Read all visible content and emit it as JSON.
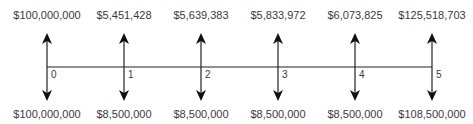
{
  "diagram": {
    "type": "cash-flow-timeline",
    "periods": [
      {
        "period": "0",
        "inflow": "$100,000,000",
        "outflow": "$100,000,000"
      },
      {
        "period": "1",
        "inflow": "$5,451,428",
        "outflow": "$8,500,000"
      },
      {
        "period": "2",
        "inflow": "$5,639,383",
        "outflow": "$8,500,000"
      },
      {
        "period": "3",
        "inflow": "$5,833,972",
        "outflow": "$8,500,000"
      },
      {
        "period": "4",
        "inflow": "$6,073,825",
        "outflow": "$8,500,000"
      },
      {
        "period": "5",
        "inflow": "$125,518,703",
        "outflow": "$108,500,000"
      }
    ],
    "colors": {
      "line": "#222222",
      "text": "#3a3a3a"
    }
  }
}
